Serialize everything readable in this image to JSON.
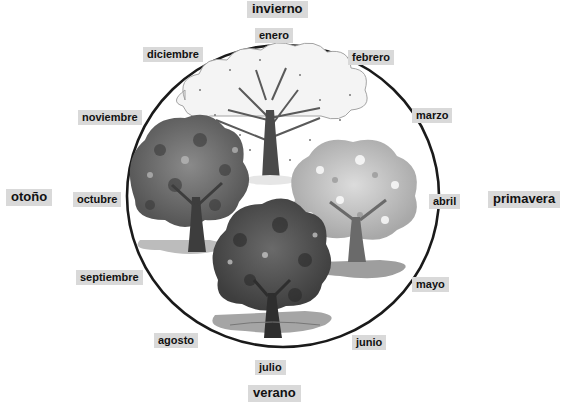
{
  "seasons": {
    "winter": "invierno",
    "spring": "primavera",
    "summer": "verano",
    "autumn": "otoño"
  },
  "months": {
    "jan": "enero",
    "feb": "febrero",
    "mar": "marzo",
    "apr": "abril",
    "may": "mayo",
    "jun": "junio",
    "jul": "julio",
    "aug": "agosto",
    "sep": "septiembre",
    "oct": "octubre",
    "nov": "noviembre",
    "dec": "diciembre"
  },
  "illustration": {
    "description": "circular seasonal cycle with four trees: bare winter tree, blossoming spring tree, full summer tree, autumn tree"
  }
}
